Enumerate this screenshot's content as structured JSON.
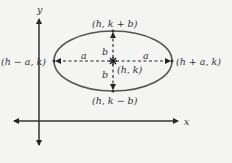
{
  "figure": {
    "axes": {
      "x_label": "x",
      "y_label": "y"
    },
    "center_label": "(h, k)",
    "vertices": {
      "top": "(h, k + b)",
      "bottom": "(h, k − b)",
      "left": "(h − a, k)",
      "right": "(h + a, k)"
    },
    "segment_labels": {
      "left_a": "a",
      "right_a": "a",
      "top_b": "b",
      "bottom_b": "b"
    },
    "colors": {
      "ellipse": "#555555",
      "axes": "#333333",
      "dashes": "#222222",
      "background": "#f4f4f2"
    }
  }
}
